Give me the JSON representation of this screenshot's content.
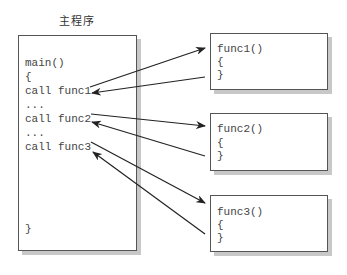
{
  "main_program": {
    "title": "主程序",
    "lines": [
      "main()",
      "{",
      "call func1",
      "...",
      "call func2",
      "...",
      "call func3",
      "}"
    ]
  },
  "functions": [
    {
      "lines": [
        "func1()",
        "{",
        "}"
      ]
    },
    {
      "lines": [
        "func2()",
        "{",
        "}"
      ]
    },
    {
      "lines": [
        "func3()",
        "{",
        "}"
      ]
    }
  ],
  "colors": {
    "border": "#555555",
    "shadow": "#c8c8c8",
    "arrow": "#222222",
    "text": "#444444"
  }
}
